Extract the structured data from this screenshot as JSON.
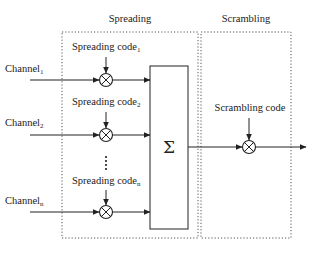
{
  "sections": {
    "spreading": {
      "title": "Spreading"
    },
    "scrambling": {
      "title": "Scrambling"
    }
  },
  "channels": [
    {
      "name": "Channel",
      "sub": "1",
      "code": "Spreading code",
      "code_sub": "1"
    },
    {
      "name": "Channel",
      "sub": "2",
      "code": "Spreading code",
      "code_sub": "2"
    },
    {
      "name": "Channel",
      "sub": "n",
      "code": "Spreading code",
      "code_sub": "n"
    }
  ],
  "ellipsis": "⋮",
  "summer": {
    "symbol": "Σ"
  },
  "scrambler": {
    "code_label": "Scrambling code"
  },
  "icons": {
    "multiplier": "circled-x",
    "summer": "sigma"
  }
}
